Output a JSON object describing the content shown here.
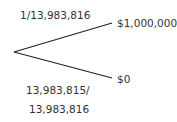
{
  "diagram": {
    "type": "probability-tree",
    "root": {
      "x": 14,
      "y": 52
    },
    "branches": [
      {
        "probability": "1/13,983,816",
        "outcome": "$1,000,000",
        "end": {
          "x": 112,
          "y": 23
        }
      },
      {
        "probability_line1": "13,983,815/",
        "probability_line2": "13,983,816",
        "outcome": "$0",
        "end": {
          "x": 112,
          "y": 78
        }
      }
    ],
    "line_color": "#222222",
    "text_color": "#333333"
  }
}
